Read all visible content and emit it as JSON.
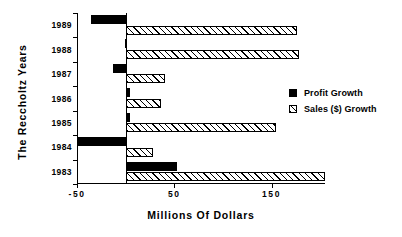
{
  "chart_data": {
    "type": "bar",
    "orientation": "horizontal",
    "title": "",
    "xlabel": "Millions  Of  Dollars",
    "ylabel": "The  Reccholtz  Years",
    "categories": [
      "1989",
      "1988",
      "1987",
      "1986",
      "1985",
      "1984",
      "1983"
    ],
    "xlim": [
      -50,
      205
    ],
    "xticks": [
      -50,
      50,
      150
    ],
    "xtick_labels": [
      "-50",
      "50",
      "150"
    ],
    "grid": false,
    "legend_position": "right",
    "series": [
      {
        "name": "Profit Growth",
        "style": "solid-black",
        "color": "#000000",
        "values": [
          -36,
          -1,
          -13,
          4,
          5,
          -49,
          53
        ]
      },
      {
        "name": "Sales ($) Growth",
        "style": "hatched-diagonal",
        "color": "#ffffff",
        "values": [
          176,
          178,
          40,
          36,
          155,
          28,
          205
        ]
      }
    ]
  },
  "legend": {
    "items": [
      {
        "label": "Profit Growth"
      },
      {
        "label": "Sales ($) Growth"
      }
    ]
  }
}
